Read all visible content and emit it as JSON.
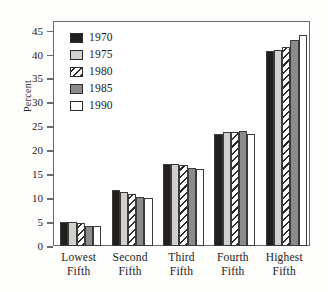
{
  "chart_data": {
    "type": "bar",
    "title": "",
    "xlabel": "",
    "ylabel": "Percent",
    "ylim": [
      0,
      47
    ],
    "yticks": [
      0,
      5,
      10,
      15,
      20,
      25,
      30,
      35,
      40,
      45
    ],
    "grid": false,
    "legend_position": "top-left",
    "categories": [
      "Lowest Fifth",
      "Second Fifth",
      "Third Fifth",
      "Fourth Fifth",
      "Highest Fifth"
    ],
    "category_lines": [
      [
        "Lowest",
        "Fifth"
      ],
      [
        "Second",
        "Fifth"
      ],
      [
        "Third",
        "Fifth"
      ],
      [
        "Fourth",
        "Fifth"
      ],
      [
        "Highest",
        "Fifth"
      ]
    ],
    "series": [
      {
        "name": "1970",
        "pattern": "solid-black",
        "color": "#231f1e",
        "values": [
          5.0,
          11.8,
          17.2,
          23.4,
          40.7
        ]
      },
      {
        "name": "1975",
        "pattern": "light-gray",
        "color": "#d2d0cd",
        "values": [
          5.0,
          11.2,
          17.2,
          23.8,
          41.0
        ]
      },
      {
        "name": "1980",
        "pattern": "diagonal-hatch",
        "color": "#ffffff",
        "values": [
          4.9,
          10.9,
          17.0,
          23.9,
          41.5
        ]
      },
      {
        "name": "1985",
        "pattern": "mid-gray",
        "color": "#8d8b88",
        "values": [
          4.1,
          10.3,
          16.4,
          24.0,
          43.1
        ]
      },
      {
        "name": "1990",
        "pattern": "white",
        "color": "#ffffff",
        "values": [
          4.1,
          10.1,
          16.0,
          23.4,
          44.1
        ]
      }
    ]
  }
}
